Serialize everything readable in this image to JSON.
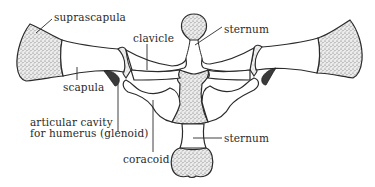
{
  "diagram": {
    "labels": {
      "suprascapula": "suprascapula",
      "clavicle": "clavicle",
      "sternum_top": "sternum",
      "scapula": "scapula",
      "glenoid_line1": "articular cavity",
      "glenoid_line2": "for humerus (glenoid)",
      "sternum_bottom": "sternum",
      "coracoid": "coracoid"
    },
    "colors": {
      "line": "#2b2b2b",
      "stipple": "#9a9a9a",
      "background": "#ffffff",
      "glenoid": "#3a3a3a"
    }
  }
}
